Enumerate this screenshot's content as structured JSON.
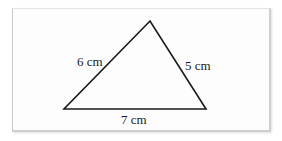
{
  "figure": {
    "type": "triangle",
    "vertices": {
      "apex": [
        150,
        21
      ],
      "bottom_left": [
        64,
        109
      ],
      "bottom_right": [
        206,
        109
      ]
    },
    "stroke_color": "#1a1a1a",
    "background_color": "#fdfdfd"
  },
  "labels": {
    "left_side": "6 cm",
    "right_side": "5 cm",
    "base": "7 cm"
  }
}
